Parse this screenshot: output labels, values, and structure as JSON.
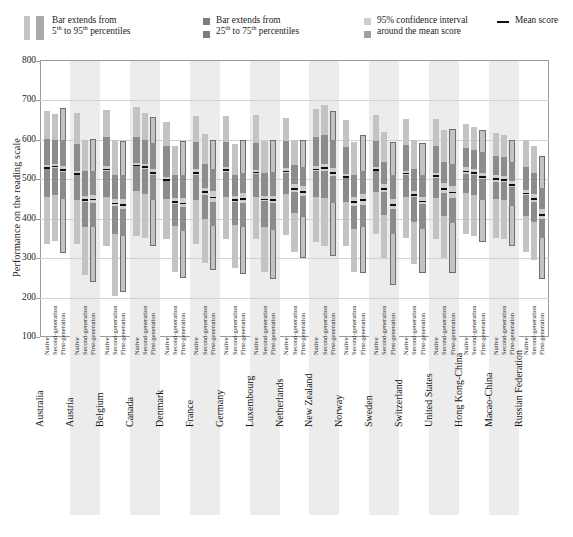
{
  "legend": {
    "items": [
      {
        "id": "p5-95",
        "line1": "Bar extends from",
        "line2": "5th to 95th percentiles",
        "sup1": "th",
        "sup2": "th",
        "swatch": "two-light-bars"
      },
      {
        "id": "p25-75",
        "line1": "Bar extends from",
        "line2": "25th to 75th percentiles",
        "sup1": "th",
        "sup2": "th",
        "swatch": "two-dark-squares"
      },
      {
        "id": "ci95",
        "line1": "95% confidence interval",
        "line2": "around the mean score",
        "swatch": "two-ci-squares"
      },
      {
        "id": "mean",
        "line1": "Mean score",
        "swatch": "mean-line"
      }
    ],
    "text": {
      "bar_extends_from": "Bar extends from",
      "p5_95": "5",
      "p5_95_b": " to 95",
      "p5_95_c": " percentiles",
      "p25_75": "25",
      "p25_75_b": " to 75",
      "p25_75_c": " percentiles",
      "ci_line1": "95% confidence interval",
      "ci_line2": "around the mean score",
      "mean_label": "Mean score",
      "sup": "th"
    }
  },
  "chart_data": {
    "type": "bar",
    "title": "",
    "ylabel": "Performance on the reading scale",
    "xlabel": "",
    "ylim": [
      100,
      800
    ],
    "yticks": [
      100,
      200,
      300,
      400,
      500,
      600,
      700,
      800
    ],
    "grid": true,
    "legend_position": "top",
    "series_labels": [
      "Native",
      "Second-generation",
      "First-generation"
    ],
    "categories": [
      "Australia",
      "Austria",
      "Belgium",
      "Canada",
      "Denmark",
      "France",
      "Germany",
      "Luxembourg",
      "Netherlands",
      "New Zealand",
      "Norway",
      "Sweden",
      "Switzerland",
      "United States",
      "Hong Kong-China",
      "Macao-China",
      "Russian Federation"
    ],
    "bars": [
      {
        "country": "Australia",
        "generation": "Native",
        "p5": 337,
        "p95": 672,
        "p25": 455,
        "p75": 602,
        "mean": 531,
        "ci_lo": 527,
        "ci_hi": 535
      },
      {
        "country": "Australia",
        "generation": "Second-generation",
        "p5": 344,
        "p95": 666,
        "p25": 460,
        "p75": 600,
        "mean": 534,
        "ci_lo": 528,
        "ci_hi": 540
      },
      {
        "country": "Australia",
        "generation": "First-generation",
        "p5": 312,
        "p95": 682,
        "p25": 450,
        "p75": 600,
        "mean": 526,
        "ci_lo": 518,
        "ci_hi": 534
      },
      {
        "country": "Austria",
        "generation": "Native",
        "p5": 335,
        "p95": 668,
        "p25": 447,
        "p75": 590,
        "mean": 516,
        "ci_lo": 510,
        "ci_hi": 522
      },
      {
        "country": "Austria",
        "generation": "Second-generation",
        "p5": 258,
        "p95": 600,
        "p25": 378,
        "p75": 520,
        "mean": 450,
        "ci_lo": 443,
        "ci_hi": 457
      },
      {
        "country": "Austria",
        "generation": "First-generation",
        "p5": 240,
        "p95": 602,
        "p25": 380,
        "p75": 520,
        "mean": 451,
        "ci_lo": 441,
        "ci_hi": 461
      },
      {
        "country": "Belgium",
        "generation": "Native",
        "p5": 330,
        "p95": 676,
        "p25": 455,
        "p75": 606,
        "mean": 527,
        "ci_lo": 521,
        "ci_hi": 533
      },
      {
        "country": "Belgium",
        "generation": "Second-generation",
        "p5": 205,
        "p95": 600,
        "p25": 360,
        "p75": 512,
        "mean": 441,
        "ci_lo": 432,
        "ci_hi": 450
      },
      {
        "country": "Belgium",
        "generation": "First-generation",
        "p5": 215,
        "p95": 597,
        "p25": 355,
        "p75": 510,
        "mean": 437,
        "ci_lo": 425,
        "ci_hi": 449
      },
      {
        "country": "Canada",
        "generation": "Native",
        "p5": 355,
        "p95": 683,
        "p25": 470,
        "p75": 608,
        "mean": 537,
        "ci_lo": 533,
        "ci_hi": 541
      },
      {
        "country": "Canada",
        "generation": "Second-generation",
        "p5": 350,
        "p95": 668,
        "p25": 462,
        "p75": 600,
        "mean": 533,
        "ci_lo": 527,
        "ci_hi": 539
      },
      {
        "country": "Canada",
        "generation": "First-generation",
        "p5": 330,
        "p95": 657,
        "p25": 448,
        "p75": 592,
        "mean": 518,
        "ci_lo": 510,
        "ci_hi": 526
      },
      {
        "country": "Denmark",
        "generation": "Native",
        "p5": 348,
        "p95": 645,
        "p25": 450,
        "p75": 585,
        "mean": 500,
        "ci_lo": 495,
        "ci_hi": 505
      },
      {
        "country": "Denmark",
        "generation": "Second-generation",
        "p5": 265,
        "p95": 585,
        "p25": 382,
        "p75": 510,
        "mean": 445,
        "ci_lo": 437,
        "ci_hi": 453
      },
      {
        "country": "Denmark",
        "generation": "First-generation",
        "p5": 250,
        "p95": 598,
        "p25": 370,
        "p75": 512,
        "mean": 441,
        "ci_lo": 429,
        "ci_hi": 453
      },
      {
        "country": "France",
        "generation": "Native",
        "p5": 335,
        "p95": 660,
        "p25": 448,
        "p75": 595,
        "mean": 518,
        "ci_lo": 511,
        "ci_hi": 525
      },
      {
        "country": "France",
        "generation": "Second-generation",
        "p5": 288,
        "p95": 614,
        "p25": 400,
        "p75": 540,
        "mean": 470,
        "ci_lo": 461,
        "ci_hi": 479
      },
      {
        "country": "France",
        "generation": "First-generation",
        "p5": 270,
        "p95": 600,
        "p25": 382,
        "p75": 525,
        "mean": 456,
        "ci_lo": 442,
        "ci_hi": 470
      },
      {
        "country": "Germany",
        "generation": "Native",
        "p5": 348,
        "p95": 660,
        "p25": 455,
        "p75": 594,
        "mean": 525,
        "ci_lo": 518,
        "ci_hi": 532
      },
      {
        "country": "Germany",
        "generation": "Second-generation",
        "p5": 275,
        "p95": 590,
        "p25": 383,
        "p75": 512,
        "mean": 450,
        "ci_lo": 442,
        "ci_hi": 458
      },
      {
        "country": "Germany",
        "generation": "First-generation",
        "p5": 260,
        "p95": 600,
        "p25": 380,
        "p75": 517,
        "mean": 452,
        "ci_lo": 440,
        "ci_hi": 464
      },
      {
        "country": "Luxembourg",
        "generation": "Native",
        "p5": 348,
        "p95": 662,
        "p25": 455,
        "p75": 592,
        "mean": 519,
        "ci_lo": 514,
        "ci_hi": 524
      },
      {
        "country": "Luxembourg",
        "generation": "Second-generation",
        "p5": 265,
        "p95": 598,
        "p25": 378,
        "p75": 517,
        "mean": 451,
        "ci_lo": 444,
        "ci_hi": 458
      },
      {
        "country": "Luxembourg",
        "generation": "First-generation",
        "p5": 248,
        "p95": 600,
        "p25": 372,
        "p75": 518,
        "mean": 449,
        "ci_lo": 440,
        "ci_hi": 458
      },
      {
        "country": "Netherlands",
        "generation": "Native",
        "p5": 358,
        "p95": 655,
        "p25": 463,
        "p75": 597,
        "mean": 522,
        "ci_lo": 516,
        "ci_hi": 528
      },
      {
        "country": "Netherlands",
        "generation": "Second-generation",
        "p5": 315,
        "p95": 600,
        "p25": 415,
        "p75": 535,
        "mean": 478,
        "ci_lo": 468,
        "ci_hi": 488
      },
      {
        "country": "Netherlands",
        "generation": "First-generation",
        "p5": 300,
        "p95": 600,
        "p25": 405,
        "p75": 532,
        "mean": 470,
        "ci_lo": 457,
        "ci_hi": 483
      },
      {
        "country": "New Zealand",
        "generation": "Native",
        "p5": 340,
        "p95": 678,
        "p25": 455,
        "p75": 607,
        "mean": 527,
        "ci_lo": 521,
        "ci_hi": 533
      },
      {
        "country": "New Zealand",
        "generation": "Second-generation",
        "p5": 330,
        "p95": 688,
        "p25": 452,
        "p75": 612,
        "mean": 530,
        "ci_lo": 520,
        "ci_hi": 540
      },
      {
        "country": "New Zealand",
        "generation": "First-generation",
        "p5": 305,
        "p95": 672,
        "p25": 440,
        "p75": 600,
        "mean": 518,
        "ci_lo": 508,
        "ci_hi": 528
      },
      {
        "country": "Norway",
        "generation": "Native",
        "p5": 330,
        "p95": 650,
        "p25": 443,
        "p75": 583,
        "mean": 508,
        "ci_lo": 502,
        "ci_hi": 514
      },
      {
        "country": "Norway",
        "generation": "Second-generation",
        "p5": 265,
        "p95": 595,
        "p25": 375,
        "p75": 512,
        "mean": 444,
        "ci_lo": 432,
        "ci_hi": 456
      },
      {
        "country": "Norway",
        "generation": "First-generation",
        "p5": 262,
        "p95": 612,
        "p25": 378,
        "p75": 520,
        "mean": 449,
        "ci_lo": 435,
        "ci_hi": 463
      },
      {
        "country": "Sweden",
        "generation": "Native",
        "p5": 360,
        "p95": 662,
        "p25": 468,
        "p75": 598,
        "mean": 526,
        "ci_lo": 520,
        "ci_hi": 532
      },
      {
        "country": "Sweden",
        "generation": "Second-generation",
        "p5": 300,
        "p95": 620,
        "p25": 410,
        "p75": 545,
        "mean": 478,
        "ci_lo": 468,
        "ci_hi": 488
      },
      {
        "country": "Sweden",
        "generation": "First-generation",
        "p5": 232,
        "p95": 595,
        "p25": 360,
        "p75": 510,
        "mean": 437,
        "ci_lo": 424,
        "ci_hi": 450
      },
      {
        "country": "Switzerland",
        "generation": "Native",
        "p5": 352,
        "p95": 652,
        "p25": 455,
        "p75": 588,
        "mean": 517,
        "ci_lo": 512,
        "ci_hi": 522
      },
      {
        "country": "Switzerland",
        "generation": "Second-generation",
        "p5": 285,
        "p95": 600,
        "p25": 392,
        "p75": 525,
        "mean": 462,
        "ci_lo": 454,
        "ci_hi": 470
      },
      {
        "country": "Switzerland",
        "generation": "First-generation",
        "p5": 262,
        "p95": 592,
        "p25": 375,
        "p75": 512,
        "mean": 446,
        "ci_lo": 437,
        "ci_hi": 455
      },
      {
        "country": "United States",
        "generation": "Native",
        "p5": 348,
        "p95": 652,
        "p25": 452,
        "p75": 585,
        "mean": 510,
        "ci_lo": 503,
        "ci_hi": 517
      },
      {
        "country": "United States",
        "generation": "Second-generation",
        "p5": 300,
        "p95": 625,
        "p25": 408,
        "p75": 545,
        "mean": 478,
        "ci_lo": 466,
        "ci_hi": 490
      },
      {
        "country": "United States",
        "generation": "First-generation",
        "p5": 262,
        "p95": 628,
        "p25": 390,
        "p75": 540,
        "mean": 468,
        "ci_lo": 453,
        "ci_hi": 483
      },
      {
        "country": "Hong Kong-China",
        "generation": "Native",
        "p5": 360,
        "p95": 640,
        "p25": 465,
        "p75": 580,
        "mean": 522,
        "ci_lo": 514,
        "ci_hi": 530
      },
      {
        "country": "Hong Kong-China",
        "generation": "Second-generation",
        "p5": 355,
        "p95": 632,
        "p25": 460,
        "p75": 575,
        "mean": 518,
        "ci_lo": 511,
        "ci_hi": 525
      },
      {
        "country": "Hong Kong-China",
        "generation": "First-generation",
        "p5": 340,
        "p95": 625,
        "p25": 448,
        "p75": 568,
        "mean": 508,
        "ci_lo": 500,
        "ci_hi": 516
      },
      {
        "country": "Macao-China",
        "generation": "Native",
        "p5": 352,
        "p95": 618,
        "p25": 450,
        "p75": 560,
        "mean": 502,
        "ci_lo": 494,
        "ci_hi": 510
      },
      {
        "country": "Macao-China",
        "generation": "Second-generation",
        "p5": 348,
        "p95": 612,
        "p25": 448,
        "p75": 556,
        "mean": 500,
        "ci_lo": 492,
        "ci_hi": 508
      },
      {
        "country": "Macao-China",
        "generation": "First-generation",
        "p5": 330,
        "p95": 600,
        "p25": 432,
        "p75": 545,
        "mean": 488,
        "ci_lo": 480,
        "ci_hi": 496
      },
      {
        "country": "Russian Federation",
        "generation": "Native",
        "p5": 315,
        "p95": 600,
        "p25": 408,
        "p75": 530,
        "mean": 466,
        "ci_lo": 459,
        "ci_hi": 473
      },
      {
        "country": "Russian Federation",
        "generation": "Second-generation",
        "p5": 295,
        "p95": 585,
        "p25": 392,
        "p75": 515,
        "mean": 452,
        "ci_lo": 442,
        "ci_hi": 462
      },
      {
        "country": "Russian Federation",
        "generation": "First-generation",
        "p5": 248,
        "p95": 560,
        "p25": 352,
        "p75": 478,
        "mean": 412,
        "ci_lo": 400,
        "ci_hi": 424
      }
    ]
  },
  "colors": {
    "p5_95": "#c3c3c3",
    "p25_75": "#8c8c8c",
    "ci": "#cccccc",
    "mean": "#0d0d0d",
    "band": "#ececec",
    "grid": "#d2d2d2",
    "frame": "#9a9a9a"
  }
}
